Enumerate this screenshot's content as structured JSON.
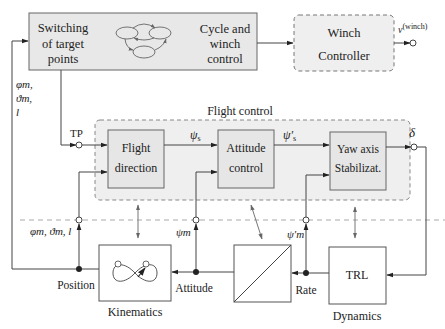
{
  "top_block": {
    "switching_line1": "Switching",
    "switching_line2": "of target",
    "switching_line3": "points",
    "cycle_line1": "Cycle and",
    "cycle_line2": "winch",
    "cycle_line3": "control"
  },
  "winch": {
    "line1": "Winch",
    "line2": "Controller",
    "output_label": "v",
    "output_sup": "(winch)"
  },
  "flight_control": {
    "title": "Flight control",
    "input_label": "TP",
    "flight_direction_line1": "Flight",
    "flight_direction_line2": "direction",
    "attitude_line1": "Attitude",
    "attitude_line2": "control",
    "yaw_line1": "Yaw axis",
    "yaw_line2": "Stabilizat.",
    "psi_s": "ψ",
    "psi_s_sub": "s",
    "psi_s_prime": "ψ′",
    "psi_s_prime_sub": "s",
    "output_label": "δ"
  },
  "feedback": {
    "left_label_line1": "φm,",
    "left_label_line2": "ϑm,",
    "left_label_line3": "l",
    "pos_label": "φm, ϑm, l",
    "psi_m": "ψm",
    "psi_m_prime": "ψ′m"
  },
  "plant": {
    "kinematics_label": "Kinematics",
    "dynamics_label": "Dynamics",
    "trl_label": "TRL",
    "position_label": "Position",
    "attitude_label": "Attitude",
    "rate_label": "Rate"
  },
  "colors": {
    "block_fill": "#e8e8e8",
    "group_fill": "#efefef",
    "line": "#555555",
    "dash": "#999999"
  }
}
